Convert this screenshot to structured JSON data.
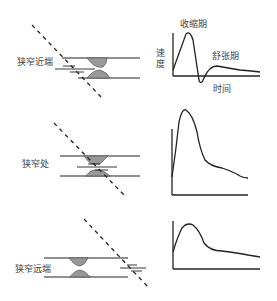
{
  "panels": [
    {
      "id": "proximal",
      "label": "狭窄近端",
      "waveform": "sharp systolic peak with brief reversal, low diastolic flow",
      "annotations": {
        "systole": "收缩期",
        "diastole": "舒张期",
        "y_axis": "速度",
        "x_axis": "时间"
      }
    },
    {
      "id": "stenosis",
      "label": "狭窄处",
      "waveform": "high-velocity broadened systolic peak with gradual decay"
    },
    {
      "id": "distal",
      "label": "狭窄远端",
      "waveform": "dampened rounded systolic peak (tardus-parvus)"
    }
  ],
  "colors": {
    "line": "#222222",
    "plaque": "#999999",
    "text": "#444444"
  }
}
